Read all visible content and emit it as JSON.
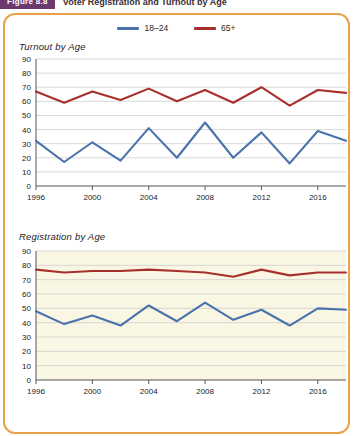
{
  "header": {
    "figure_badge": "Figure 8.8",
    "title": "Voter Registration and Turnout by Age"
  },
  "legend": {
    "position": "top-center",
    "items": [
      {
        "label": "18–24",
        "color": "#4a72ab",
        "icon": "line-swatch-blue"
      },
      {
        "label": "65+",
        "color": "#a8302c",
        "icon": "line-swatch-red"
      }
    ]
  },
  "colors": {
    "series_18_24": "#4a72ab",
    "series_65_plus": "#a8302c",
    "card_border": "#e8a24a",
    "badge": "#6b3a6e",
    "panel_top_bg": "#ffffff",
    "panel_bottom_bg": "#faf6e4",
    "gridline": "#c9c9c9",
    "axis": "#555555"
  },
  "chart_data": [
    {
      "type": "line",
      "title": "Turnout by Age",
      "xlabel": "",
      "ylabel": "",
      "ylim": [
        0,
        90
      ],
      "yticks": [
        0,
        10,
        20,
        30,
        40,
        50,
        60,
        70,
        80,
        90
      ],
      "grid": true,
      "legend_position": "top-center",
      "x": [
        1996,
        1998,
        2000,
        2002,
        2004,
        2006,
        2008,
        2010,
        2012,
        2014,
        2016,
        2018
      ],
      "xticks": [
        1996,
        2000,
        2004,
        2008,
        2012,
        2016
      ],
      "series": [
        {
          "name": "18–24",
          "color": "#4a72ab",
          "values": [
            32,
            17,
            31,
            18,
            41,
            20,
            45,
            20,
            38,
            16,
            39,
            32
          ]
        },
        {
          "name": "65+",
          "color": "#a8302c",
          "values": [
            67,
            59,
            67,
            61,
            69,
            60,
            68,
            59,
            70,
            57,
            68,
            66
          ]
        }
      ]
    },
    {
      "type": "line",
      "title": "Registration by Age",
      "xlabel": "",
      "ylabel": "",
      "ylim": [
        0,
        90
      ],
      "yticks": [
        0,
        10,
        20,
        30,
        40,
        50,
        60,
        70,
        80,
        90
      ],
      "grid": true,
      "legend_position": "top-center",
      "x": [
        1996,
        1998,
        2000,
        2002,
        2004,
        2006,
        2008,
        2010,
        2012,
        2014,
        2016,
        2018
      ],
      "xticks": [
        1996,
        2000,
        2004,
        2008,
        2012,
        2016
      ],
      "series": [
        {
          "name": "18–24",
          "color": "#4a72ab",
          "values": [
            48,
            39,
            45,
            38,
            52,
            41,
            54,
            42,
            49,
            38,
            50,
            49
          ]
        },
        {
          "name": "65+",
          "color": "#a8302c",
          "values": [
            77,
            75,
            76,
            76,
            77,
            76,
            75,
            72,
            77,
            73,
            75,
            75
          ]
        }
      ]
    }
  ]
}
